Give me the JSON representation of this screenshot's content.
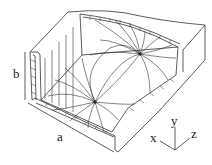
{
  "diagram": {
    "type": "rectangular waveguide cutaway with field lines",
    "labels": {
      "width": "a",
      "height": "b"
    },
    "axes": {
      "x": "x",
      "y": "y",
      "z": "z"
    },
    "colors": {
      "line": "#333333",
      "background": "#ffffff"
    }
  }
}
